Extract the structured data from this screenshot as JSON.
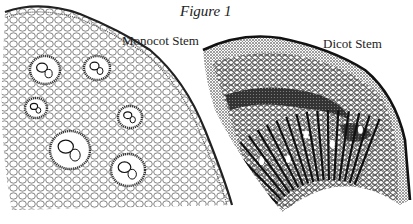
{
  "figure": {
    "title": "Figure 1",
    "labels": {
      "monocot": "Monocot Stem",
      "dicot": "Dicot Stem"
    }
  },
  "colors": {
    "background": "#ffffff",
    "ink": "#1a1a1a",
    "shade": "#555555"
  },
  "monocot": {
    "bundles": [
      {
        "cx": 45,
        "cy": 70,
        "r": 12
      },
      {
        "cx": 97,
        "cy": 68,
        "r": 10
      },
      {
        "cx": 130,
        "cy": 117,
        "r": 9
      },
      {
        "cx": 70,
        "cy": 150,
        "r": 17
      },
      {
        "cx": 128,
        "cy": 170,
        "r": 14
      },
      {
        "cx": 36,
        "cy": 108,
        "r": 8
      }
    ]
  },
  "dicot": {
    "rays": 22
  }
}
